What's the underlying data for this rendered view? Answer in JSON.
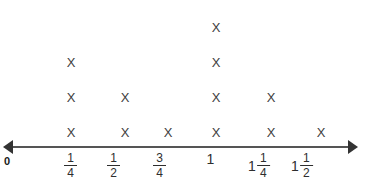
{
  "chart_data": {
    "type": "dot_plot",
    "title": "",
    "xlabel": "",
    "ylabel": "",
    "grid": false,
    "legend": null,
    "mark_symbol": "X",
    "origin_label": "0",
    "axis": {
      "left_arrow": true,
      "right_arrow": true,
      "min_label": "0",
      "tick_labels": [
        "1/4",
        "1/2",
        "3/4",
        "1",
        "1 1/4",
        "1 1/2"
      ]
    },
    "categories": [
      "1/4",
      "1/2",
      "3/4",
      "1",
      "1 1/4",
      "1 1/2"
    ],
    "values": [
      3,
      2,
      1,
      4,
      2,
      1
    ],
    "points": [
      {
        "label": "1/4",
        "whole": "",
        "numerator": "1",
        "denominator": "4",
        "count": 3,
        "x_px": 71
      },
      {
        "label": "1/2",
        "whole": "",
        "numerator": "1",
        "denominator": "2",
        "count": 2,
        "x_px": 125
      },
      {
        "label": "3/4",
        "whole": "",
        "numerator": "3",
        "denominator": "4",
        "count": 1,
        "x_px": 168
      },
      {
        "label": "1",
        "whole": "1",
        "numerator": "",
        "denominator": "",
        "count": 4,
        "x_px": 216
      },
      {
        "label": "1 1/4",
        "whole": "1",
        "numerator": "1",
        "denominator": "4",
        "count": 2,
        "x_px": 271
      },
      {
        "label": "1 1/2",
        "whole": "1",
        "numerator": "1",
        "denominator": "2",
        "count": 1,
        "x_px": 321
      }
    ],
    "tick_x_px": [
      70,
      113,
      159,
      211,
      259,
      302
    ],
    "colors": {
      "mark": "#3d3d3d",
      "axis": "#555555",
      "arrow": "#333333",
      "text": "#2e2e2e",
      "zero": "#1a1a1a",
      "background": "#ffffff"
    }
  }
}
